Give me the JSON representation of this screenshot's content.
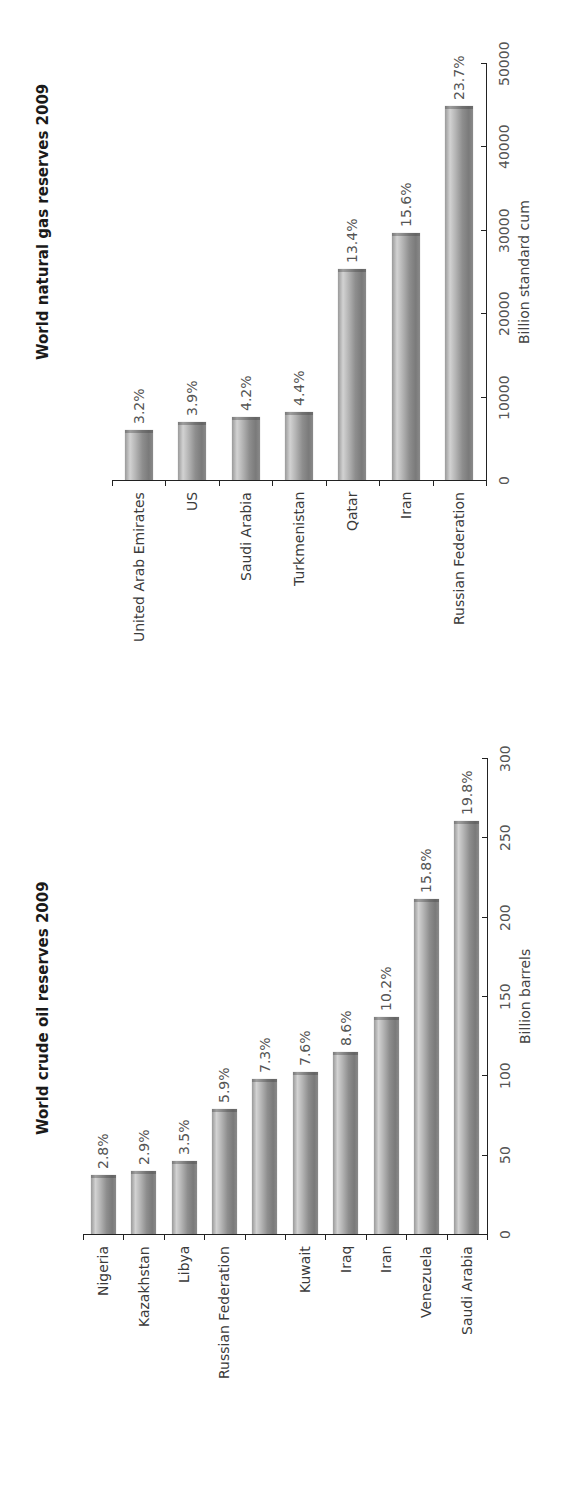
{
  "page": {
    "width": 572,
    "height": 1489,
    "orientation": "rotated-90-ccw"
  },
  "colors": {
    "bar": "#9a9a9a",
    "axis": "#222222",
    "text": "#444444",
    "background": "#ffffff"
  },
  "chart_data": [
    {
      "id": "gas",
      "type": "bar",
      "orientation": "vertical-bars (page rotated 90°)",
      "title": "World natural gas reserves 2009",
      "xlabel": "",
      "ylabel": "Billion standard cum",
      "ylim": [
        0,
        50000
      ],
      "yticks": [
        "0",
        "10000",
        "20000",
        "30000",
        "40000",
        "50000"
      ],
      "grid": false,
      "legend": null,
      "categories": [
        "United Arab Emirates",
        "US",
        "Saudi Arabia",
        "Turkmenistan",
        "Qatar",
        "Iran",
        "Russian Federation"
      ],
      "values": [
        6000,
        6900,
        7500,
        8100,
        25300,
        29600,
        44900
      ],
      "data_labels": [
        "3.2%",
        "3.9%",
        "4.2%",
        "4.4%",
        "13.4%",
        "15.6%",
        "23.7%"
      ]
    },
    {
      "id": "oil",
      "type": "bar",
      "orientation": "vertical-bars (page rotated 90°)",
      "title": "World crude oil reserves 2009",
      "xlabel": "",
      "ylabel": "Billion barrels",
      "ylim": [
        0,
        300
      ],
      "yticks": [
        "0",
        "50",
        "100",
        "150",
        "200",
        "250",
        "300"
      ],
      "grid": false,
      "legend": null,
      "categories": [
        "Nigeria",
        "Kazakhstan",
        "Libya",
        "Russian Federation",
        "",
        "Kuwait",
        "Iraq",
        "Iran",
        "Venezuela",
        "Saudi Arabia"
      ],
      "values": [
        37,
        40,
        46,
        79,
        98,
        102,
        115,
        137,
        211,
        260
      ],
      "data_labels": [
        "2.8%",
        "2.9%",
        "3.5%",
        "5.9%",
        "7.3%",
        "7.6%",
        "8.6%",
        "10.2%",
        "15.8%",
        "19.8%"
      ]
    }
  ],
  "layout": {
    "gas": {
      "title_x": 34,
      "title_y": 360,
      "axis_x0": 112,
      "axis_x1": 486,
      "axis_y": 480,
      "axis_top_y": 63,
      "bar_width": 28,
      "label_gap": 6
    },
    "oil": {
      "title_x": 34,
      "title_y": 1135,
      "axis_x0": 83,
      "axis_x1": 487,
      "axis_y": 1234,
      "axis_top_y": 758,
      "bar_width": 25,
      "label_gap": 6
    }
  }
}
